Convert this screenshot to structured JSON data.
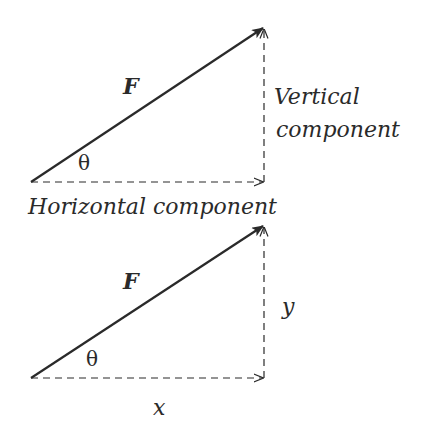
{
  "diagrams": [
    {
      "vector_label": "F",
      "angle_label": "θ",
      "vertical_label_line1": "Vertical",
      "vertical_label_line2": "component",
      "horizontal_label": "Horizontal component"
    },
    {
      "vector_label": "F",
      "angle_label": "θ",
      "vertical_label": "y",
      "horizontal_label": "x"
    }
  ],
  "colors": {
    "line": "#2a2a2a",
    "background": "#ffffff"
  }
}
